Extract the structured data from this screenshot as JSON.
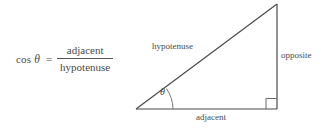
{
  "figure": {
    "background_color": "#ffffff",
    "line_color": "#4a4a4a",
    "text_color": "#4a4a4a"
  },
  "formula": {
    "function_name": "cos",
    "angle_symbol": "θ",
    "equals": "=",
    "numerator": "adjacent",
    "denominator": "hypotenuse"
  },
  "triangle": {
    "labels": {
      "hypotenuse": "hypotenuse",
      "opposite": "opposite",
      "adjacent": "adjacent",
      "angle": "θ"
    },
    "vertices": {
      "left": [
        136,
        109
      ],
      "bottom_right": [
        277,
        109
      ],
      "top_right": [
        277,
        4
      ]
    },
    "right_angle_marker": true,
    "angle_arc": true
  }
}
